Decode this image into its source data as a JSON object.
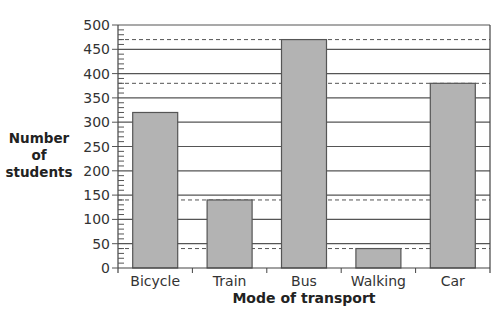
{
  "chart_data": {
    "type": "bar",
    "title": "",
    "xlabel": "Mode of transport",
    "ylabel": "Number of students",
    "ylabel_lines": [
      "Number",
      "of",
      "students"
    ],
    "categories": [
      "Bicycle",
      "Train",
      "Bus",
      "Walking",
      "Car"
    ],
    "values": [
      320,
      140,
      470,
      40,
      380
    ],
    "ylim": [
      0,
      500
    ],
    "yticks": [
      0,
      50,
      100,
      150,
      200,
      250,
      300,
      350,
      400,
      450,
      500
    ],
    "minor_tick_step": 10,
    "grid": true,
    "dashed_reference_lines": [
      470,
      380,
      140,
      40
    ],
    "bar_color": "#b3b3b3",
    "legend": null
  }
}
